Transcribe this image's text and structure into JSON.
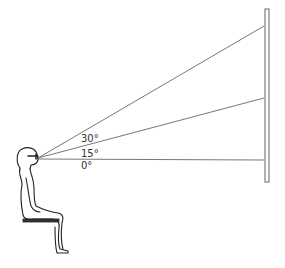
{
  "diagram": {
    "angles": [
      {
        "label": "30°",
        "value": 30
      },
      {
        "label": "15°",
        "value": 15
      },
      {
        "label": "0°",
        "value": 0
      }
    ],
    "colors": {
      "stroke": "#555555",
      "figure": "#222222"
    }
  }
}
